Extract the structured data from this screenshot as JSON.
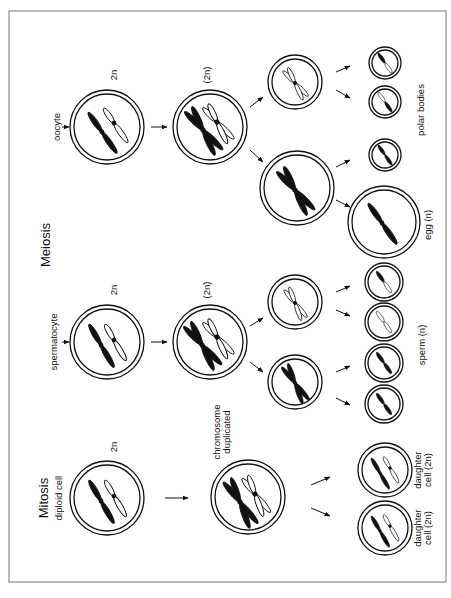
{
  "figure": {
    "sections": {
      "mitosis": {
        "title": "Mitosis",
        "start_label": "diploid cell"
      },
      "meiosis": {
        "title": "Meiosis"
      }
    },
    "labels": {
      "oocyte": "oocyte",
      "spermatocyte": "spermatocyte",
      "ploidy_2n": "2n",
      "ploidy_2n_paren": "(2n)",
      "chromosome_line1": "chromosome",
      "chromosome_line2": "duplicated",
      "polar_bodies": "polar bodies",
      "egg": "egg  (n)",
      "sperm": "sperm  (n)",
      "daughter_line1": "daughter",
      "daughter_line2": "cell (2n)"
    },
    "rows": [
      {
        "name": "oocyte",
        "stages": [
          "2n",
          "(2n)",
          "secondary (large + small)",
          "egg (n) + polar bodies"
        ]
      },
      {
        "name": "spermatocyte",
        "stages": [
          "2n",
          "(2n)",
          "two secondary",
          "sperm (n) x4"
        ]
      },
      {
        "name": "mitosis",
        "stages": [
          "diploid cell 2n",
          "chromosome duplicated",
          "daughter cell (2n) x2"
        ]
      }
    ]
  }
}
